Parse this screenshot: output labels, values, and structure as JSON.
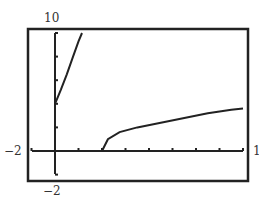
{
  "chart_data": {
    "type": "line",
    "title": "",
    "xlabel": "",
    "ylabel": "",
    "xlim": [
      -2,
      16
    ],
    "ylim": [
      -2,
      10
    ],
    "x_tick_spacing": 2,
    "y_tick_spacing": 2,
    "grid": false,
    "legend": null,
    "labels": {
      "ymax": "10",
      "ymin": "−2",
      "xmin": "−2",
      "xmax": "1"
    },
    "series": [
      {
        "name": "branch-left",
        "points": [
          [
            0,
            4
          ],
          [
            0.5,
            5.2
          ],
          [
            1,
            6.5
          ],
          [
            1.5,
            7.9
          ],
          [
            2,
            9.3
          ],
          [
            2.3,
            10
          ]
        ]
      },
      {
        "name": "branch-right",
        "points": [
          [
            4,
            0
          ],
          [
            4.5,
            1
          ],
          [
            5.5,
            1.6
          ],
          [
            7,
            2
          ],
          [
            9,
            2.4
          ],
          [
            11,
            2.8
          ],
          [
            13,
            3.2
          ],
          [
            15,
            3.5
          ],
          [
            16,
            3.6
          ]
        ]
      }
    ]
  },
  "colors": {
    "frame": "#222222",
    "axis": "#222222",
    "curve": "#222222",
    "background": "#ffffff"
  }
}
